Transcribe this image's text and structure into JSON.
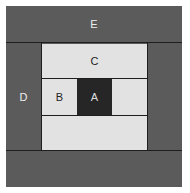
{
  "diagram": {
    "regions": [
      {
        "id": "E",
        "label": "E"
      },
      {
        "id": "D",
        "label": "D"
      },
      {
        "id": "C",
        "label": "C"
      },
      {
        "id": "B",
        "label": "B"
      },
      {
        "id": "A",
        "label": "A"
      }
    ]
  },
  "colors": {
    "outer": "#5b5b5b",
    "inner": "#e2e2e2",
    "center": "#262626"
  }
}
